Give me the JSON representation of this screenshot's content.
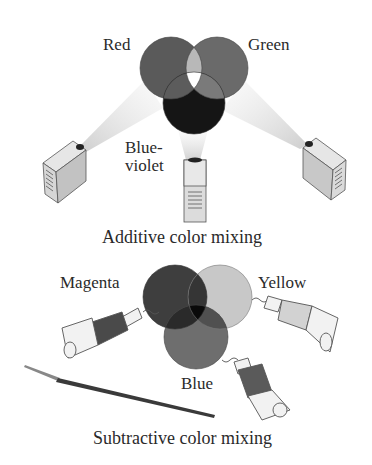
{
  "additive": {
    "caption": "Additive color mixing",
    "labels": {
      "red": "Red",
      "green": "Green",
      "blue_line1": "Blue-",
      "blue_line2": "violet"
    },
    "colors": {
      "red": "#5a5a5a",
      "green": "#6a6a6a",
      "blue": "#151515",
      "red_green": "#b8b8b8",
      "center": "#ffffff"
    }
  },
  "subtractive": {
    "caption": "Subtractive color mixing",
    "labels": {
      "magenta": "Magenta",
      "yellow": "Yellow",
      "blue": "Blue"
    },
    "colors": {
      "magenta": "#3e3e3e",
      "yellow": "#c8c8c8",
      "blue": "#6e6e6e",
      "center": "#0a0a0a"
    }
  }
}
